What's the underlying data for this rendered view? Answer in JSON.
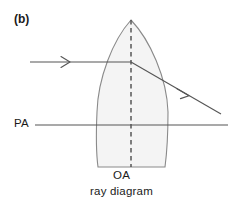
{
  "figure": {
    "panel_label": "(b)",
    "caption": "ray diagram",
    "background_color": "#ffffff"
  },
  "labels": {
    "principal_axis": "PA",
    "optical_axis": "OA"
  },
  "diagram": {
    "type": "optics-ray-diagram",
    "line_color": "#555555",
    "lens_fill_color": "#f4f4f4",
    "lens_stroke_color": "#8a8a8a",
    "lens": {
      "apex_x": 131,
      "apex_y": 20,
      "left_edge_x": 97,
      "right_edge_x": 168,
      "widest_y": 112,
      "bottom_cut_y": 167
    },
    "optical_axis_line": {
      "x": 131,
      "y_top": 20,
      "y_bottom": 167,
      "style": "dashed"
    },
    "principal_axis_line": {
      "x_start": 35,
      "x_end": 228,
      "y": 125,
      "style": "solid"
    },
    "incident_ray": {
      "x_start": 30,
      "x_end": 131,
      "y": 62,
      "arrow_at_x": 68,
      "direction": "right"
    },
    "refracted_ray": {
      "x_start": 131,
      "y_start": 62,
      "x_end": 220,
      "y_end": 113,
      "arrow_at_x": 188,
      "direction": "down-right"
    }
  }
}
